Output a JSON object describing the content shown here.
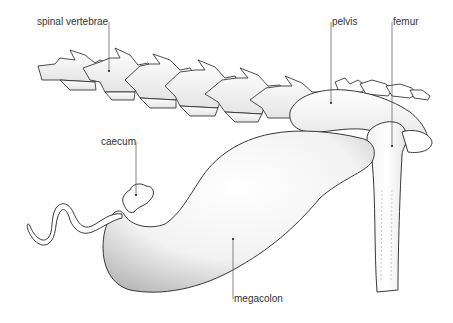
{
  "figure": {
    "labels": {
      "spinal_vertebrae": "spinal vertebrae",
      "pelvis": "pelvis",
      "femur": "femur",
      "caecum": "caecum",
      "megacolon": "megacolon"
    },
    "colors": {
      "ink": "#222222",
      "leader": "#555555",
      "shade": "#9a9a9a",
      "fill": "#fbfbfb"
    }
  }
}
